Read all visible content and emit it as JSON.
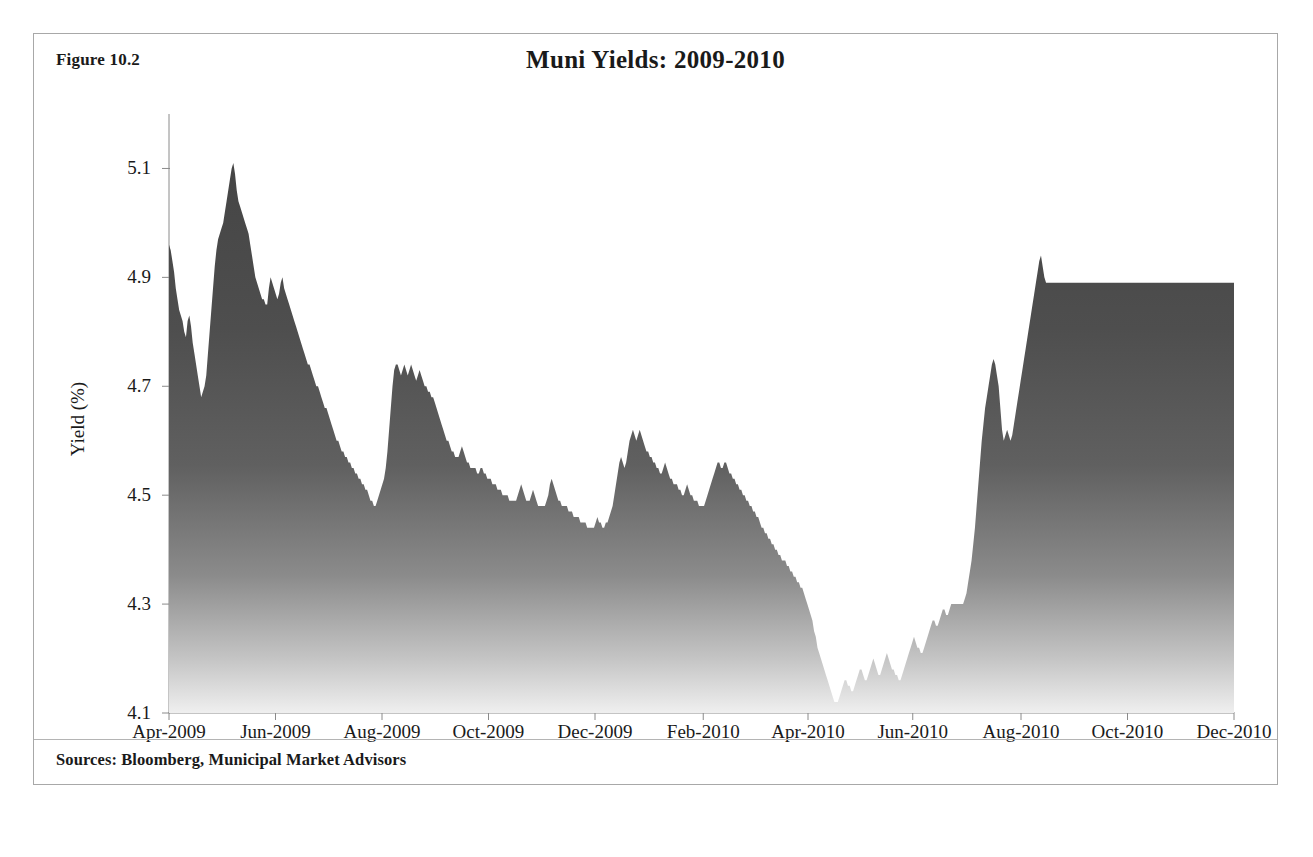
{
  "figure": {
    "number": "Figure 10.2",
    "title": "Muni Yields: 2009-2010",
    "sources": "Sources: Bloomberg, Municipal Market Advisors"
  },
  "colors": {
    "area_top": "#4a4a4a",
    "area_bottom": "#f2f2f2",
    "frame_border": "#a8a8a8",
    "axis": "#8a8a8a",
    "text": "#1a1a1a"
  },
  "chart_data": {
    "type": "area",
    "title": "Muni Yields: 2009-2010",
    "xlabel": "",
    "ylabel": "Yield (%)",
    "ylim": [
      4.1,
      5.2
    ],
    "yticks": [
      4.1,
      4.3,
      4.5,
      4.7,
      4.9,
      5.1
    ],
    "ytick_labels": [
      "4.1",
      "4.3",
      "4.5",
      "4.7",
      "4.9",
      "5.1"
    ],
    "xtick_labels": [
      "Apr-2009",
      "Jun-2009",
      "Aug-2009",
      "Oct-2009",
      "Dec-2009",
      "Feb-2010",
      "Apr-2010",
      "Jun-2010",
      "Aug-2010",
      "Oct-2010",
      "Dec-2010"
    ],
    "xtick_positions": [
      0,
      61,
      122,
      183,
      244,
      306,
      366,
      426,
      488,
      549,
      610
    ],
    "x_start": "Apr-2009",
    "x_end": "Dec-2010",
    "x_total_points": 630,
    "grid": false,
    "legend": false,
    "series": [
      {
        "name": "Muni Yield",
        "units": "%",
        "values": [
          4.96,
          4.95,
          4.93,
          4.91,
          4.88,
          4.86,
          4.84,
          4.83,
          4.82,
          4.8,
          4.79,
          4.82,
          4.83,
          4.81,
          4.78,
          4.76,
          4.74,
          4.72,
          4.7,
          4.68,
          4.69,
          4.7,
          4.72,
          4.76,
          4.8,
          4.84,
          4.88,
          4.92,
          4.95,
          4.97,
          4.98,
          4.99,
          5.0,
          5.02,
          5.04,
          5.06,
          5.08,
          5.1,
          5.11,
          5.09,
          5.06,
          5.04,
          5.03,
          5.02,
          5.01,
          5.0,
          4.99,
          4.98,
          4.96,
          4.94,
          4.92,
          4.9,
          4.89,
          4.88,
          4.87,
          4.86,
          4.86,
          4.85,
          4.85,
          4.88,
          4.9,
          4.89,
          4.88,
          4.87,
          4.86,
          4.87,
          4.89,
          4.9,
          4.88,
          4.87,
          4.86,
          4.85,
          4.84,
          4.83,
          4.82,
          4.81,
          4.8,
          4.79,
          4.78,
          4.77,
          4.76,
          4.75,
          4.74,
          4.74,
          4.73,
          4.72,
          4.71,
          4.7,
          4.7,
          4.69,
          4.68,
          4.67,
          4.66,
          4.66,
          4.65,
          4.64,
          4.63,
          4.62,
          4.61,
          4.6,
          4.6,
          4.59,
          4.58,
          4.58,
          4.57,
          4.57,
          4.56,
          4.56,
          4.55,
          4.55,
          4.54,
          4.54,
          4.53,
          4.53,
          4.52,
          4.52,
          4.51,
          4.51,
          4.5,
          4.49,
          4.49,
          4.48,
          4.48,
          4.49,
          4.5,
          4.51,
          4.52,
          4.53,
          4.55,
          4.58,
          4.62,
          4.66,
          4.7,
          4.73,
          4.74,
          4.74,
          4.73,
          4.72,
          4.73,
          4.74,
          4.73,
          4.72,
          4.73,
          4.74,
          4.73,
          4.72,
          4.71,
          4.72,
          4.73,
          4.72,
          4.71,
          4.7,
          4.7,
          4.69,
          4.69,
          4.68,
          4.68,
          4.67,
          4.66,
          4.65,
          4.64,
          4.63,
          4.62,
          4.61,
          4.6,
          4.6,
          4.59,
          4.58,
          4.58,
          4.57,
          4.57,
          4.57,
          4.58,
          4.59,
          4.58,
          4.57,
          4.56,
          4.56,
          4.55,
          4.55,
          4.55,
          4.55,
          4.54,
          4.54,
          4.55,
          4.55,
          4.54,
          4.54,
          4.53,
          4.53,
          4.53,
          4.52,
          4.52,
          4.52,
          4.51,
          4.51,
          4.51,
          4.5,
          4.5,
          4.5,
          4.5,
          4.49,
          4.49,
          4.49,
          4.49,
          4.49,
          4.5,
          4.51,
          4.52,
          4.51,
          4.5,
          4.49,
          4.49,
          4.49,
          4.5,
          4.51,
          4.5,
          4.49,
          4.48,
          4.48,
          4.48,
          4.48,
          4.48,
          4.49,
          4.5,
          4.52,
          4.53,
          4.52,
          4.51,
          4.5,
          4.49,
          4.49,
          4.48,
          4.48,
          4.48,
          4.48,
          4.47,
          4.47,
          4.47,
          4.46,
          4.46,
          4.46,
          4.46,
          4.45,
          4.45,
          4.45,
          4.45,
          4.44,
          4.44,
          4.44,
          4.44,
          4.44,
          4.45,
          4.46,
          4.45,
          4.45,
          4.44,
          4.44,
          4.45,
          4.45,
          4.46,
          4.47,
          4.48,
          4.5,
          4.52,
          4.54,
          4.56,
          4.57,
          4.56,
          4.55,
          4.56,
          4.58,
          4.6,
          4.61,
          4.62,
          4.61,
          4.6,
          4.61,
          4.62,
          4.61,
          4.6,
          4.59,
          4.58,
          4.58,
          4.57,
          4.57,
          4.56,
          4.56,
          4.55,
          4.55,
          4.54,
          4.54,
          4.55,
          4.56,
          4.55,
          4.54,
          4.53,
          4.53,
          4.52,
          4.52,
          4.52,
          4.51,
          4.51,
          4.5,
          4.5,
          4.51,
          4.52,
          4.51,
          4.5,
          4.5,
          4.49,
          4.49,
          4.49,
          4.48,
          4.48,
          4.48,
          4.48,
          4.49,
          4.5,
          4.51,
          4.52,
          4.53,
          4.54,
          4.55,
          4.56,
          4.56,
          4.55,
          4.55,
          4.56,
          4.56,
          4.55,
          4.54,
          4.54,
          4.53,
          4.53,
          4.52,
          4.52,
          4.51,
          4.51,
          4.5,
          4.5,
          4.49,
          4.49,
          4.48,
          4.48,
          4.47,
          4.47,
          4.46,
          4.46,
          4.45,
          4.44,
          4.44,
          4.43,
          4.43,
          4.42,
          4.42,
          4.41,
          4.41,
          4.4,
          4.4,
          4.39,
          4.39,
          4.38,
          4.38,
          4.38,
          4.37,
          4.37,
          4.36,
          4.36,
          4.35,
          4.35,
          4.34,
          4.34,
          4.33,
          4.33,
          4.32,
          4.31,
          4.3,
          4.29,
          4.28,
          4.27,
          4.25,
          4.24,
          4.22,
          4.21,
          4.2,
          4.19,
          4.18,
          4.17,
          4.16,
          4.15,
          4.14,
          4.13,
          4.12,
          4.12,
          4.12,
          4.13,
          4.14,
          4.15,
          4.16,
          4.16,
          4.15,
          4.15,
          4.14,
          4.14,
          4.15,
          4.16,
          4.17,
          4.18,
          4.18,
          4.17,
          4.16,
          4.16,
          4.17,
          4.18,
          4.19,
          4.2,
          4.19,
          4.18,
          4.17,
          4.17,
          4.18,
          4.19,
          4.2,
          4.21,
          4.2,
          4.19,
          4.18,
          4.18,
          4.17,
          4.17,
          4.16,
          4.16,
          4.17,
          4.18,
          4.19,
          4.2,
          4.21,
          4.22,
          4.23,
          4.24,
          4.23,
          4.22,
          4.22,
          4.21,
          4.21,
          4.22,
          4.23,
          4.24,
          4.25,
          4.26,
          4.27,
          4.27,
          4.26,
          4.26,
          4.27,
          4.28,
          4.29,
          4.29,
          4.28,
          4.28,
          4.29,
          4.3,
          4.3,
          4.3,
          4.3,
          4.3,
          4.3,
          4.3,
          4.3,
          4.31,
          4.32,
          4.34,
          4.36,
          4.38,
          4.41,
          4.44,
          4.48,
          4.52,
          4.56,
          4.6,
          4.63,
          4.66,
          4.68,
          4.7,
          4.72,
          4.74,
          4.75,
          4.74,
          4.72,
          4.7,
          4.66,
          4.62,
          4.6,
          4.61,
          4.62,
          4.61,
          4.6,
          4.61,
          4.63,
          4.65,
          4.67,
          4.69,
          4.71,
          4.73,
          4.75,
          4.77,
          4.79,
          4.81,
          4.83,
          4.85,
          4.87,
          4.89,
          4.91,
          4.93,
          4.94,
          4.92,
          4.9,
          4.89,
          4.89,
          4.89,
          4.89,
          4.89,
          4.89,
          4.89,
          4.89,
          4.89,
          4.89,
          4.89,
          4.89,
          4.89,
          4.89,
          4.89,
          4.89,
          4.89,
          4.89,
          4.89,
          4.89,
          4.89,
          4.89,
          4.89,
          4.89,
          4.89,
          4.89,
          4.89,
          4.89,
          4.89,
          4.89,
          4.89,
          4.89,
          4.89,
          4.89,
          4.89,
          4.89,
          4.89,
          4.89,
          4.89,
          4.89,
          4.89,
          4.89,
          4.89,
          4.89,
          4.89,
          4.89,
          4.89,
          4.89,
          4.89,
          4.89,
          4.89,
          4.89,
          4.89,
          4.89,
          4.89,
          4.89,
          4.89,
          4.89,
          4.89,
          4.89,
          4.89,
          4.89,
          4.89,
          4.89,
          4.89,
          4.89,
          4.89,
          4.89,
          4.89,
          4.89,
          4.89,
          4.89,
          4.89,
          4.89,
          4.89,
          4.89,
          4.89,
          4.89,
          4.89,
          4.89,
          4.89,
          4.89,
          4.89,
          4.89,
          4.89,
          4.89,
          4.89,
          4.89,
          4.89,
          4.89,
          4.89,
          4.89,
          4.89,
          4.89,
          4.89,
          4.89,
          4.89,
          4.89,
          4.89,
          4.89,
          4.89,
          4.89,
          4.89,
          4.89,
          4.89,
          4.89,
          4.89,
          4.89,
          4.89,
          4.89,
          4.89,
          4.89
        ]
      }
    ]
  }
}
